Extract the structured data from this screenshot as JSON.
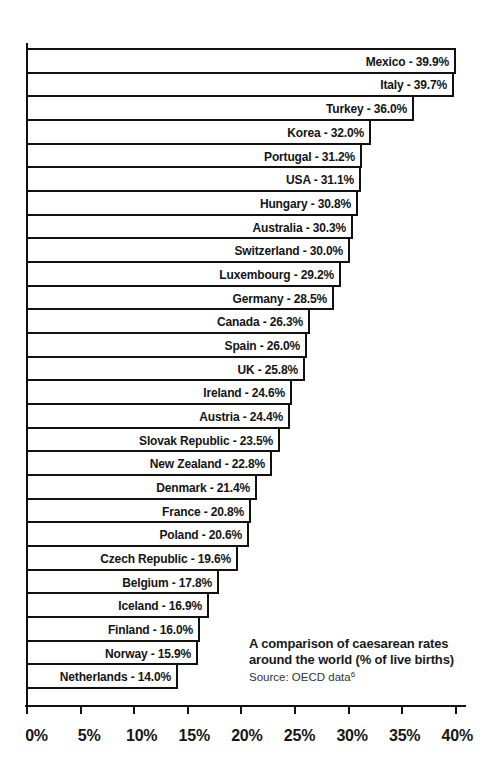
{
  "chart_data": {
    "type": "bar",
    "orientation": "horizontal",
    "title": "A comparison of caesarean rates around the world (% of live births)",
    "source": "Source: OECD data",
    "source_footnote": "6",
    "xlabel": "",
    "ylabel": "",
    "xlim": [
      0,
      40
    ],
    "grid": false,
    "legend": null,
    "xticks": [
      "0%",
      "5%",
      "10%",
      "15%",
      "20%",
      "25%",
      "30%",
      "35%",
      "40%"
    ],
    "categories": [
      "Mexico",
      "Italy",
      "Turkey",
      "Korea",
      "Portugal",
      "USA",
      "Hungary",
      "Australia",
      "Switzerland",
      "Luxembourg",
      "Germany",
      "Canada",
      "Spain",
      "UK",
      "Ireland",
      "Austria",
      "Slovak Republic",
      "New Zealand",
      "Denmark",
      "France",
      "Poland",
      "Czech Republic",
      "Belgium",
      "Iceland",
      "Finland",
      "Norway",
      "Netherlands"
    ],
    "values": [
      39.9,
      39.7,
      36.0,
      32.0,
      31.2,
      31.1,
      30.8,
      30.3,
      30.0,
      29.2,
      28.5,
      26.3,
      26.0,
      25.8,
      24.6,
      24.4,
      23.5,
      22.8,
      21.4,
      20.8,
      20.6,
      19.6,
      17.8,
      16.9,
      16.0,
      15.9,
      14.0
    ],
    "bar_labels": [
      "Mexico - 39.9%",
      "Italy - 39.7%",
      "Turkey - 36.0%",
      "Korea - 32.0%",
      "Portugal - 31.2%",
      "USA - 31.1%",
      "Hungary - 30.8%",
      "Australia - 30.3%",
      "Switzerland - 30.0%",
      "Luxembourg - 29.2%",
      "Germany - 28.5%",
      "Canada - 26.3%",
      "Spain - 26.0%",
      "UK - 25.8%",
      "Ireland - 24.6%",
      "Austria - 24.4%",
      "Slovak Republic - 23.5%",
      "New Zealand - 22.8%",
      "Denmark - 21.4%",
      "France - 20.8%",
      "Poland - 20.6%",
      "Czech Republic - 19.6%",
      "Belgium - 17.8%",
      "Iceland - 16.9%",
      "Finland - 16.0%",
      "Norway - 15.9%",
      "Netherlands - 14.0%"
    ],
    "colors": {
      "bar_fill": "#ffffff",
      "bar_outline": "#111111",
      "text": "#111111"
    }
  },
  "caption": {
    "title_line1": "A comparison of caesarean rates",
    "title_line2": "around the world (% of live births)",
    "source": "Source: OECD data",
    "footnote": "6"
  }
}
